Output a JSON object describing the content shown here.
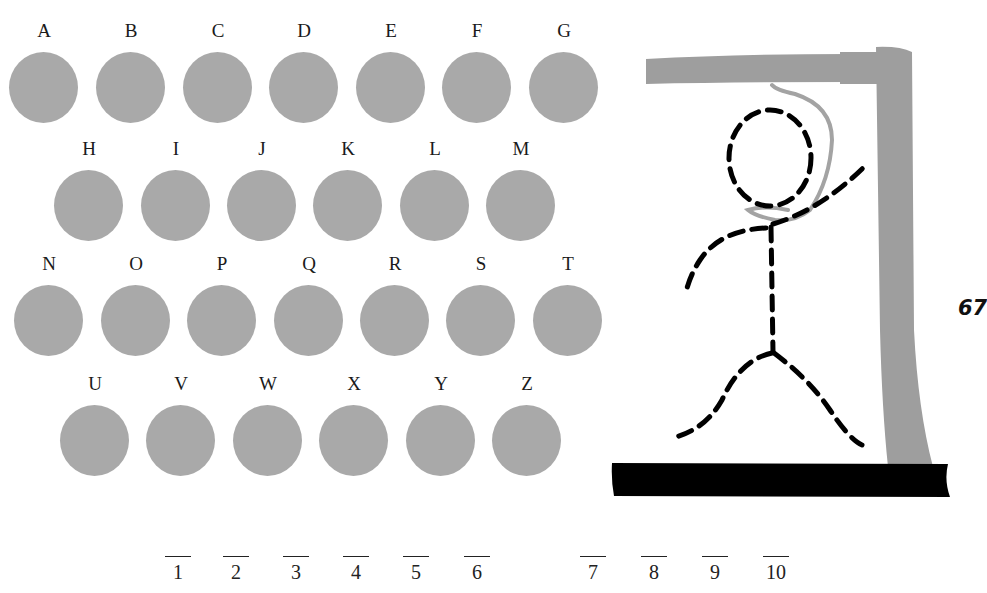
{
  "letters": [
    {
      "char": "A",
      "x": 9,
      "y": 20
    },
    {
      "char": "B",
      "x": 96,
      "y": 20
    },
    {
      "char": "C",
      "x": 183,
      "y": 20
    },
    {
      "char": "D",
      "x": 269,
      "y": 20
    },
    {
      "char": "E",
      "x": 356,
      "y": 20
    },
    {
      "char": "F",
      "x": 442,
      "y": 20
    },
    {
      "char": "G",
      "x": 529,
      "y": 20
    },
    {
      "char": "H",
      "x": 54,
      "y": 138
    },
    {
      "char": "I",
      "x": 141,
      "y": 138
    },
    {
      "char": "J",
      "x": 227,
      "y": 138
    },
    {
      "char": "K",
      "x": 313,
      "y": 138
    },
    {
      "char": "L",
      "x": 400,
      "y": 138
    },
    {
      "char": "M",
      "x": 486,
      "y": 138
    },
    {
      "char": "N",
      "x": 14,
      "y": 253
    },
    {
      "char": "O",
      "x": 101,
      "y": 253
    },
    {
      "char": "P",
      "x": 187,
      "y": 253
    },
    {
      "char": "Q",
      "x": 274,
      "y": 253
    },
    {
      "char": "R",
      "x": 360,
      "y": 253
    },
    {
      "char": "S",
      "x": 446,
      "y": 253
    },
    {
      "char": "T",
      "x": 533,
      "y": 253
    },
    {
      "char": "U",
      "x": 60,
      "y": 373
    },
    {
      "char": "V",
      "x": 146,
      "y": 373
    },
    {
      "char": "W",
      "x": 233,
      "y": 373
    },
    {
      "char": "X",
      "x": 319,
      "y": 373
    },
    {
      "char": "Y",
      "x": 406,
      "y": 373
    },
    {
      "char": "Z",
      "x": 492,
      "y": 373
    }
  ],
  "answer_slots": [
    {
      "num": "1",
      "x": 164
    },
    {
      "num": "2",
      "x": 222
    },
    {
      "num": "3",
      "x": 282
    },
    {
      "num": "4",
      "x": 342
    },
    {
      "num": "5",
      "x": 402
    },
    {
      "num": "6",
      "x": 463
    },
    {
      "num": "7",
      "x": 579
    },
    {
      "num": "8",
      "x": 640
    },
    {
      "num": "9",
      "x": 701
    },
    {
      "num": "10",
      "x": 762
    }
  ],
  "page_number": "67",
  "colors": {
    "disc": "#a9a9a9",
    "gallows": "#9e9e9e",
    "rope": "#a3a3a3",
    "figure": "#000000",
    "base": "#000000"
  },
  "icons": {
    "gallows": "gallows-icon",
    "stick_figure": "stick-figure-icon"
  }
}
